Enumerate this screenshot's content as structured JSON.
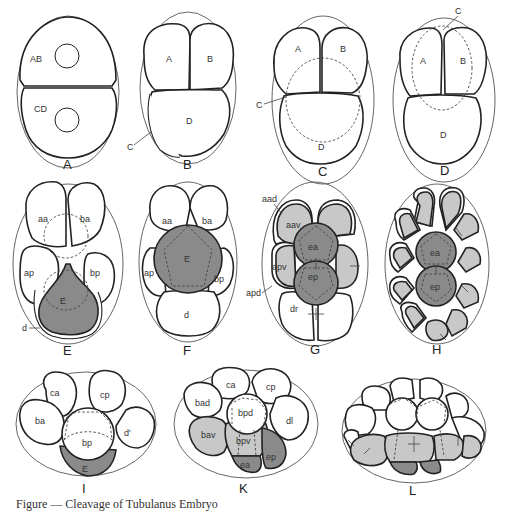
{
  "figure": {
    "caption": "Figure — Cleavage of Tubulanus  Embryo",
    "fill_colors": {
      "light": "#c8c8c8",
      "dark": "#8a8a8a",
      "cell": "#ffffff"
    },
    "panels": [
      {
        "id": "A",
        "label": "A",
        "cells": [
          "AB",
          "CD"
        ]
      },
      {
        "id": "B",
        "label": "B",
        "cells": [
          "A",
          "B",
          "C",
          "D"
        ]
      },
      {
        "id": "C",
        "label": "C",
        "cells": [
          "A",
          "B",
          "C",
          "D"
        ]
      },
      {
        "id": "D",
        "label": "D",
        "cells": [
          "A",
          "B",
          "C",
          "D"
        ]
      },
      {
        "id": "E",
        "label": "E",
        "cells": [
          "aa",
          "ba",
          "ap",
          "bp",
          "E",
          "d"
        ]
      },
      {
        "id": "F",
        "label": "F",
        "cells": [
          "aa",
          "ba",
          "ap",
          "bp",
          "E",
          "d"
        ]
      },
      {
        "id": "G",
        "label": "G",
        "cells": [
          "aad",
          "aav",
          "ea",
          "apv",
          "ep",
          "apd",
          "dr"
        ]
      },
      {
        "id": "H",
        "label": "H",
        "cells": [
          "ea",
          "ep"
        ]
      },
      {
        "id": "I",
        "label": "I",
        "cells": [
          "ca",
          "cp",
          "ba",
          "d'",
          "bp",
          "E"
        ]
      },
      {
        "id": "K",
        "label": "K",
        "cells": [
          "ca",
          "cp",
          "bad",
          "bpd",
          "dl",
          "bav",
          "bpv",
          "ea",
          "ep"
        ]
      },
      {
        "id": "L",
        "label": "L",
        "cells": []
      }
    ]
  }
}
